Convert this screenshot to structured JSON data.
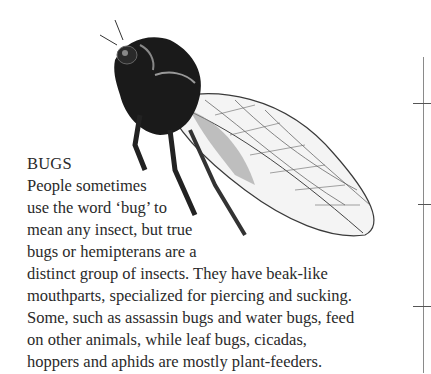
{
  "section": {
    "title": "BUGS",
    "lines": [
      "People sometimes",
      "use the word ‘bug’ to",
      "mean any insect, but true",
      "bugs or hemipterans are a",
      "distinct group of insects. They have beak-like",
      "mouthparts, specialized for piercing and sucking.",
      "Some, such as assassin bugs and water bugs, feed",
      "on other animals, while leaf bugs, cicadas,",
      "hoppers and aphids are mostly plant-feeders."
    ]
  },
  "illustration": {
    "subject": "cicada-illustration",
    "colors": {
      "body": "#1a1a1a",
      "wing_vein": "#3a3a3a",
      "wing_fill": "#f4f4f4"
    }
  },
  "ruler": {
    "color": "#8a8a8a",
    "ticks": 3
  }
}
